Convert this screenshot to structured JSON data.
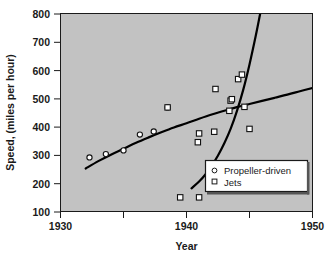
{
  "chart_data": {
    "type": "scatter",
    "title": "",
    "xlabel": "Year",
    "ylabel": "Speed, (miles per hour)",
    "xlim": [
      1930,
      1950
    ],
    "ylim": [
      100,
      800
    ],
    "xticks": [
      1930,
      1935,
      1940,
      1945,
      1950
    ],
    "xticklabels": [
      "1930",
      "",
      "1940",
      "",
      "1950"
    ],
    "yticks": [
      100,
      200,
      300,
      400,
      500,
      600,
      700,
      800
    ],
    "yticklabels": [
      "100",
      "200",
      "300",
      "400",
      "500",
      "600",
      "700",
      "800"
    ],
    "grid": false,
    "legend_position": "lower right",
    "plot_facecolor": "#c2c2c2",
    "figure_facecolor": "#ffffff",
    "series": [
      {
        "name": "Propeller-driven",
        "marker": "circle",
        "x": [
          1932.3,
          1933.6,
          1935.0,
          1936.3,
          1937.4,
          1938.5
        ],
        "y": [
          291,
          303,
          316,
          372,
          383,
          468
        ]
      },
      {
        "name": "Jets",
        "marker": "square",
        "x": [
          1938.5,
          1939.5,
          1941.0,
          1940.9,
          1941.0,
          1942.2,
          1942.3,
          1943.4,
          1943.5,
          1943.6,
          1944.1,
          1944.4,
          1944.6,
          1945.0
        ],
        "y": [
          468,
          150,
          150,
          345,
          376,
          382,
          533,
          456,
          492,
          497,
          568,
          584,
          470,
          392
        ]
      }
    ],
    "fit_curves": [
      {
        "name": "propeller-trend",
        "color": "#000000",
        "points": [
          [
            1932.0,
            252
          ],
          [
            1933.0,
            278
          ],
          [
            1934.0,
            301
          ],
          [
            1935.0,
            322
          ],
          [
            1936.0,
            343
          ],
          [
            1937.0,
            362
          ],
          [
            1938.0,
            380
          ],
          [
            1939.0,
            397
          ],
          [
            1940.0,
            412
          ],
          [
            1941.0,
            428
          ],
          [
            1942.0,
            443
          ],
          [
            1943.0,
            456
          ],
          [
            1944.0,
            469
          ],
          [
            1945.0,
            480
          ],
          [
            1946.0,
            491
          ],
          [
            1947.0,
            502
          ],
          [
            1948.0,
            513
          ],
          [
            1949.0,
            525
          ],
          [
            1950.0,
            537
          ]
        ]
      },
      {
        "name": "jet-trend",
        "color": "#000000",
        "points": [
          [
            1940.4,
            182
          ],
          [
            1941.0,
            206
          ],
          [
            1941.5,
            231
          ],
          [
            1942.0,
            262
          ],
          [
            1942.5,
            298
          ],
          [
            1943.0,
            341
          ],
          [
            1943.5,
            392
          ],
          [
            1944.0,
            455
          ],
          [
            1944.5,
            530
          ],
          [
            1945.0,
            620
          ],
          [
            1945.5,
            722
          ],
          [
            1945.85,
            800
          ]
        ]
      }
    ],
    "legend_entries": [
      {
        "label": "Propeller-driven",
        "marker": "circle"
      },
      {
        "label": "Jets",
        "marker": "square"
      }
    ]
  }
}
